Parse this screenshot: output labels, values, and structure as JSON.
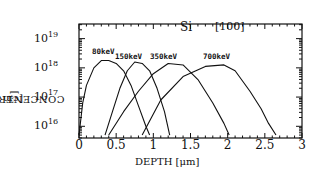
{
  "chart_data": {
    "type": "line",
    "title": "Si [100]",
    "xlabel": "DEPTH [μm]",
    "ylabel": "CONCENTRATION [cm^-3]",
    "ylabel_text": "CONCENTRATION",
    "ylabel_unit": "[cm",
    "ylabel_exp": "-3",
    "xlim": [
      0,
      3
    ],
    "ylim_log10": [
      15.6,
      19.5
    ],
    "yscale": "log",
    "grid": false,
    "x_ticks": [
      "0",
      "0.5",
      "1",
      "1.5",
      "2",
      "2.5",
      "3"
    ],
    "y_ticks": [
      {
        "base": "10",
        "exp": "19"
      },
      {
        "base": "10",
        "exp": "18"
      },
      {
        "base": "10",
        "exp": "17"
      },
      {
        "base": "10",
        "exp": "16"
      }
    ],
    "annotations": {
      "material": "Si",
      "orientation": "[100]"
    },
    "series": [
      {
        "name": "80keV",
        "x": [
          0.0,
          0.05,
          0.1,
          0.2,
          0.3,
          0.4,
          0.5,
          0.6,
          0.7,
          0.8,
          0.9,
          0.95
        ],
        "log10_y": [
          15.7,
          16.8,
          17.4,
          18.0,
          18.25,
          18.25,
          18.15,
          17.9,
          17.4,
          16.7,
          16.0,
          15.7
        ]
      },
      {
        "name": "150keV",
        "x": [
          0.35,
          0.45,
          0.55,
          0.65,
          0.75,
          0.85,
          0.95,
          1.05,
          1.15,
          1.22
        ],
        "log10_y": [
          15.7,
          16.5,
          17.3,
          17.9,
          18.2,
          18.15,
          17.9,
          17.3,
          16.5,
          15.7
        ]
      },
      {
        "name": "350keV",
        "x": [
          0.4,
          0.6,
          0.8,
          1.0,
          1.2,
          1.4,
          1.6,
          1.8,
          1.95,
          2.02
        ],
        "log10_y": [
          15.7,
          16.5,
          17.2,
          17.8,
          18.15,
          18.1,
          17.6,
          16.8,
          16.1,
          15.7
        ]
      },
      {
        "name": "700keV",
        "x": [
          0.85,
          1.1,
          1.4,
          1.7,
          1.95,
          2.1,
          2.3,
          2.45,
          2.55,
          2.65
        ],
        "log10_y": [
          15.7,
          16.9,
          17.7,
          18.05,
          18.1,
          17.9,
          17.2,
          16.6,
          16.1,
          15.7
        ]
      }
    ]
  }
}
